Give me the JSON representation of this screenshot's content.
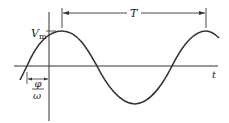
{
  "diagram": {
    "type": "sinusoid-waveform",
    "labels": {
      "amplitude": "V",
      "amplitude_sub": "m",
      "period": "T",
      "time_axis": "t",
      "phase_num": "φ",
      "phase_den": "ω"
    },
    "colors": {
      "curve": "#333333",
      "axes": "#333333",
      "background": "#ffffff"
    }
  }
}
